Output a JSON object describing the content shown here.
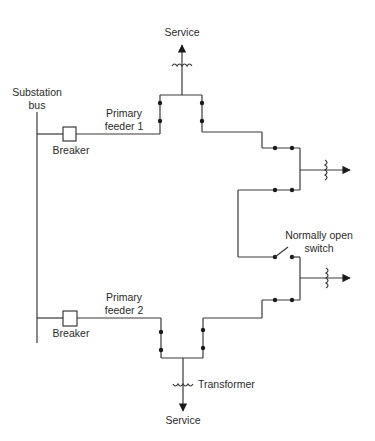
{
  "diagram": {
    "type": "primary loop distribution system",
    "colors": {
      "line": "#3a3a3a",
      "text": "#2a2a2a",
      "background": "#ffffff"
    },
    "labels": {
      "substation_bus_line1": "Substation",
      "substation_bus_line2": "bus",
      "breaker_1": "Breaker",
      "breaker_2": "Breaker",
      "feeder_1_line1": "Primary",
      "feeder_1_line2": "feeder 1",
      "feeder_2_line1": "Primary",
      "feeder_2_line2": "feeder 2",
      "service_top": "Service",
      "service_bottom": "Service",
      "transformer": "Transformer",
      "nos_line1": "Normally open",
      "nos_line2": "switch"
    },
    "nodes": [
      {
        "id": "substation-bus",
        "label": "Substation bus"
      },
      {
        "id": "breaker-1",
        "label": "Breaker"
      },
      {
        "id": "breaker-2",
        "label": "Breaker"
      },
      {
        "id": "feeder-1",
        "label": "Primary feeder 1"
      },
      {
        "id": "feeder-2",
        "label": "Primary feeder 2"
      },
      {
        "id": "service-top",
        "label": "Service"
      },
      {
        "id": "service-bottom",
        "label": "Service"
      },
      {
        "id": "transformer",
        "label": "Transformer"
      },
      {
        "id": "normally-open-switch",
        "label": "Normally open switch",
        "state": "open"
      }
    ]
  }
}
